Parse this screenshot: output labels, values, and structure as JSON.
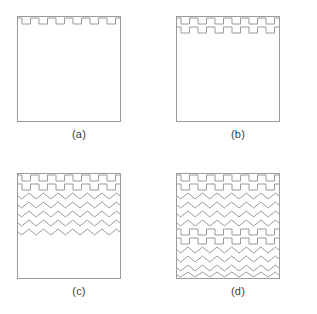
{
  "figure": {
    "title": "",
    "background_color": "#ffffff",
    "stroke_color": "#9a9a9a",
    "label_color": "#3b3b3b",
    "panel_count": 4,
    "square": {
      "width_px": 104,
      "height_px": 106,
      "fill": "#ffffff",
      "border": "#9a9a9a"
    }
  },
  "panels": [
    {
      "id": "a",
      "label": "(a)",
      "rows": [
        {
          "type": "square-wave",
          "count": 1
        }
      ],
      "square_wave_rows": 1,
      "zigzag_rows": 0,
      "description": "Square outline with a single square-wave (crenellation) row at the top edge."
    },
    {
      "id": "b",
      "label": "(b)",
      "rows": [
        {
          "type": "square-wave",
          "count": 2
        }
      ],
      "square_wave_rows": 2,
      "zigzag_rows": 0,
      "description": "Square outline with two stacked square-wave rows at the top."
    },
    {
      "id": "c",
      "label": "(c)",
      "rows": [
        {
          "type": "square-wave",
          "count": 2
        },
        {
          "type": "zigzag",
          "count": 5
        }
      ],
      "square_wave_rows": 2,
      "zigzag_rows": 5,
      "description": "Square outline with two square-wave rows followed by five zigzag rows, filling the upper half."
    },
    {
      "id": "d",
      "label": "(d)",
      "rows": [
        {
          "type": "square-wave",
          "count": 2
        },
        {
          "type": "zigzag",
          "count": 5
        },
        {
          "type": "square-wave",
          "count": 2
        },
        {
          "type": "zigzag",
          "count": 5
        }
      ],
      "square_wave_rows": 4,
      "zigzag_rows": 10,
      "description": "Square outline fully filled: the square-wave plus zigzag pattern repeated twice."
    }
  ],
  "geometry": {
    "square_wave": {
      "periods": 6,
      "row_height_px": 9,
      "amplitude_px": 5,
      "duty_cycle": 0.5
    },
    "zigzag": {
      "periods": 7,
      "row_height_px": 9,
      "amplitude_px": 4
    }
  }
}
